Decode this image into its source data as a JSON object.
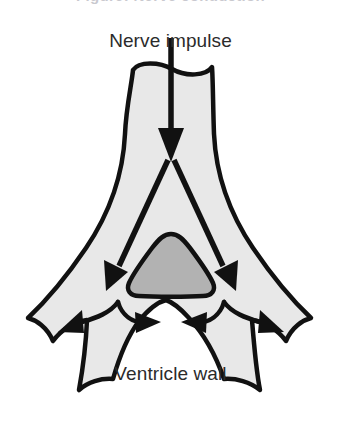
{
  "figure": {
    "kind": "anatomical-diagram",
    "cropped_caption": "Figure: Nerve conduction",
    "background_color": "#ffffff"
  },
  "labels": {
    "nerve_impulse": "Nerve impulse",
    "ventricle_wall": "Ventricle wall"
  },
  "colors": {
    "outline": "#111111",
    "wall_fill": "#e8e8e8",
    "cavity_fill": "#b2b2b2",
    "label_text": "#2b2b2b",
    "cropped_caption_text": "#c9c9cf",
    "background": "#ffffff"
  },
  "shapes": {
    "ventricle_wall": {
      "name": "ventricle-wall-outline",
      "fill": "#e8e8e8",
      "stroke": "#111111",
      "stroke_width": 4.5,
      "description": "Y-shaped ventricle cross-section: vertical neck at top with a wavy upper border, flaring into left, right and two lower pointed lobes, with a concave lower arc"
    },
    "ventricle_cavity": {
      "name": "ventricle-cavity",
      "fill": "#b2b2b2",
      "stroke": "#111111",
      "stroke_width": 4.5,
      "description": "Rounded triangular lumen at the centre of the wall"
    }
  },
  "arrows": {
    "main_impulse": {
      "name": "main-impulse-arrow",
      "direction": "down",
      "from": [
        171,
        55
      ],
      "to": [
        171,
        160
      ],
      "description": "Vertical impulse arrow entering through the neck"
    },
    "split_branches": [
      {
        "name": "impulse-branch-left",
        "direction": "down-left",
        "from": [
          169,
          160
        ],
        "to": [
          108,
          290
        ]
      },
      {
        "name": "impulse-branch-right",
        "direction": "down-right",
        "from": [
          173,
          160
        ],
        "to": [
          234,
          290
        ]
      }
    ],
    "spread_arrows": [
      {
        "name": "spread-arrow-left-outward",
        "direction": "down-left",
        "to": [
          62,
          330
        ]
      },
      {
        "name": "spread-arrow-left-inward",
        "direction": "right",
        "to": [
          136,
          321
        ]
      },
      {
        "name": "spread-arrow-right-outward",
        "direction": "down-right",
        "to": [
          280,
          330
        ]
      },
      {
        "name": "spread-arrow-right-inward",
        "direction": "left",
        "to": [
          206,
          321
        ]
      }
    ]
  }
}
